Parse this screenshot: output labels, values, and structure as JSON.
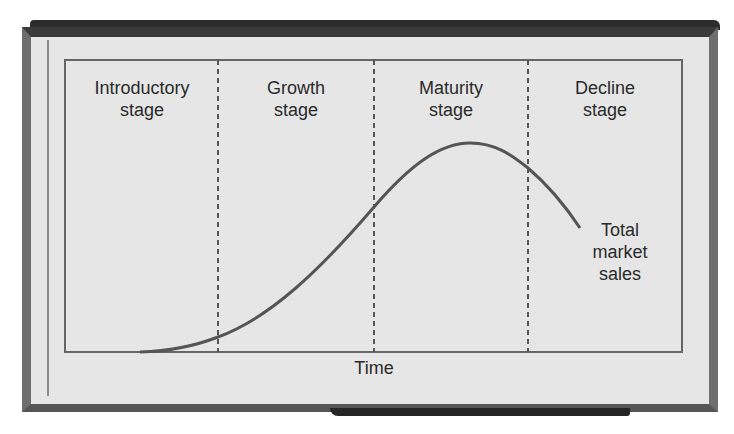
{
  "diagram": {
    "stages": [
      {
        "line1": "Introductory",
        "line2": "stage"
      },
      {
        "line1": "Growth",
        "line2": "stage"
      },
      {
        "line1": "Maturity",
        "line2": "stage"
      },
      {
        "line1": "Decline",
        "line2": "stage"
      }
    ],
    "x_axis_label": "Time",
    "curve_label": {
      "line1": "Total",
      "line2": "market",
      "line3": "sales"
    },
    "colors": {
      "frame": "#6e6e6e",
      "panel": "#e6e6e6",
      "line": "#555555",
      "text": "#2a2a2a"
    }
  }
}
